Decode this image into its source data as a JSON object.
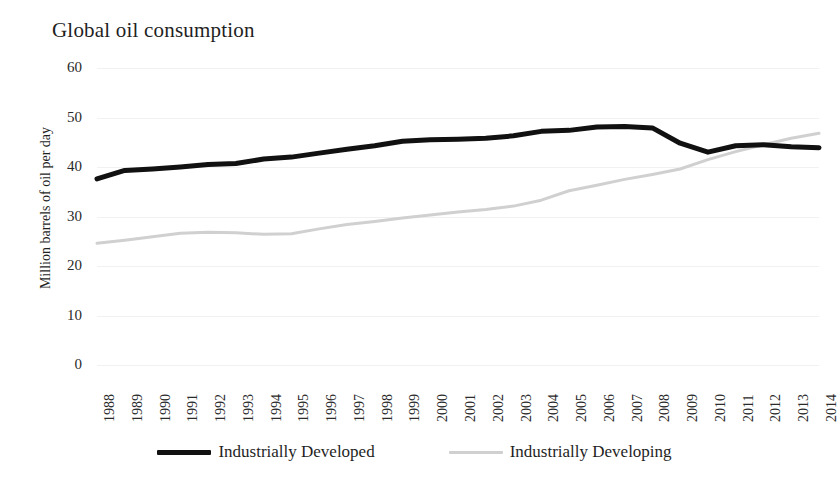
{
  "chart_data": {
    "type": "line",
    "title": "Global oil consumption",
    "xlabel": "",
    "ylabel": "Million barrels of oil per day",
    "ylim": [
      0,
      60
    ],
    "yticks": [
      0,
      10,
      20,
      30,
      40,
      50,
      60
    ],
    "grid": true,
    "legend_position": "bottom",
    "x": [
      1988,
      1989,
      1990,
      1991,
      1992,
      1993,
      1994,
      1995,
      1996,
      1997,
      1998,
      1999,
      2000,
      2001,
      2002,
      2003,
      2004,
      2005,
      2006,
      2007,
      2008,
      2009,
      2010,
      2011,
      2012,
      2013,
      2014
    ],
    "categories": [
      "1988",
      "1989",
      "1990",
      "1991",
      "1992",
      "1993",
      "1994",
      "1995",
      "1996",
      "1997",
      "1998",
      "1999",
      "2000",
      "2001",
      "2002",
      "2003",
      "2004",
      "2005",
      "2006",
      "2007",
      "2008",
      "2009",
      "2010",
      "2011",
      "2012",
      "2013",
      "2014"
    ],
    "series": [
      {
        "name": "Industrially Developed",
        "color": "#111111",
        "width": 5,
        "values": [
          37.6,
          39.3,
          39.6,
          40.0,
          40.5,
          40.7,
          41.6,
          42.0,
          42.8,
          43.6,
          44.3,
          45.2,
          45.5,
          45.6,
          45.8,
          46.3,
          47.2,
          47.4,
          48.1,
          48.2,
          47.9,
          44.8,
          43.0,
          44.3,
          44.5,
          44.1,
          43.9
        ]
      },
      {
        "name": "Industrially Developing",
        "color": "#d0d0d0",
        "width": 3,
        "values": [
          24.6,
          25.2,
          25.9,
          26.6,
          26.8,
          26.7,
          26.4,
          26.5,
          27.5,
          28.4,
          29.0,
          29.7,
          30.3,
          30.9,
          31.4,
          32.1,
          33.3,
          35.2,
          36.3,
          37.5,
          38.5,
          39.6,
          41.5,
          43.1,
          44.5,
          45.8,
          46.8
        ]
      }
    ]
  },
  "legend": {
    "entries": [
      {
        "label": "Industrially Developed"
      },
      {
        "label": "Industrially Developing"
      }
    ]
  }
}
